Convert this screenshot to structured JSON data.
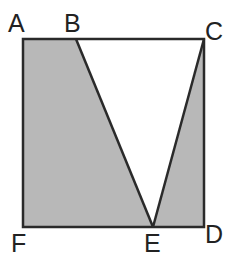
{
  "diagram": {
    "type": "geometry",
    "colors": {
      "stroke": "#2a2a2a",
      "shade": "#b8b8b8",
      "background": "#ffffff",
      "label": "#222222"
    },
    "points": {
      "A": {
        "label": "A",
        "x": 23,
        "y": 39
      },
      "B": {
        "label": "B",
        "x": 76,
        "y": 39
      },
      "C": {
        "label": "C",
        "x": 204,
        "y": 39
      },
      "D": {
        "label": "D",
        "x": 204,
        "y": 227
      },
      "E": {
        "label": "E",
        "x": 153,
        "y": 227
      },
      "F": {
        "label": "F",
        "x": 23,
        "y": 227
      }
    },
    "labels": [
      {
        "id": "A",
        "text": "A",
        "x": 8,
        "y": 32
      },
      {
        "id": "B",
        "text": "B",
        "x": 64,
        "y": 32
      },
      {
        "id": "C",
        "text": "C",
        "x": 205,
        "y": 40
      },
      {
        "id": "D",
        "text": "D",
        "x": 205,
        "y": 243
      },
      {
        "id": "E",
        "text": "E",
        "x": 144,
        "y": 252
      },
      {
        "id": "F",
        "text": "F",
        "x": 11,
        "y": 252
      }
    ],
    "shaded_regions": [
      {
        "name": "quadrilateral-ABEF",
        "vertices": [
          "A",
          "B",
          "E",
          "F"
        ]
      },
      {
        "name": "triangle-ECD",
        "vertices": [
          "E",
          "C",
          "D"
        ]
      }
    ],
    "unshaded_regions": [
      {
        "name": "triangle-BCE",
        "vertices": [
          "B",
          "C",
          "E"
        ]
      }
    ],
    "segments": [
      [
        "A",
        "C"
      ],
      [
        "C",
        "D"
      ],
      [
        "D",
        "F"
      ],
      [
        "F",
        "A"
      ],
      [
        "B",
        "E"
      ],
      [
        "E",
        "C"
      ]
    ]
  }
}
